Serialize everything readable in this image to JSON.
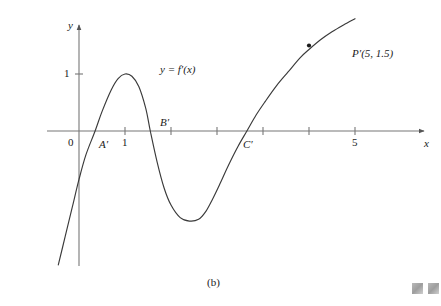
{
  "figure": {
    "caption": "(b)",
    "curve_label": "y = f′(x)",
    "axis_x_name": "x",
    "axis_y_name": "y",
    "origin_label": "0"
  },
  "annotations": {
    "point_A": "A′",
    "point_B": "B′",
    "point_C": "C′",
    "point_P": "P′(5, 1.5)"
  },
  "ticks": {
    "x": [
      {
        "value": 1,
        "label": "1"
      },
      {
        "value": 2,
        "label": ""
      },
      {
        "value": 3,
        "label": ""
      },
      {
        "value": 4,
        "label": ""
      },
      {
        "value": 5,
        "label": "5"
      }
    ],
    "y": [
      {
        "value": 1,
        "label": "1"
      }
    ]
  },
  "colors": {
    "curve": "#3a3a3a",
    "axis": "#707070",
    "text": "#1a1a1a",
    "background": "#ffffff",
    "corner_mark": "#a8a8a8"
  },
  "chart_data": {
    "type": "line",
    "title": "",
    "subtitle": "",
    "xlabel": "x",
    "ylabel": "y",
    "xlim": [
      -0.45,
      6.1
    ],
    "ylim": [
      -2.4,
      2.3
    ],
    "grid": false,
    "legend": null,
    "series": [
      {
        "name": "y = f'(x)",
        "x": [
          -0.45,
          -0.3,
          -0.15,
          0.0,
          0.15,
          0.35,
          0.5,
          0.7,
          0.85,
          1.0,
          1.15,
          1.3,
          1.45,
          1.55,
          1.7,
          1.85,
          2.0,
          2.2,
          2.4,
          2.6,
          2.75,
          2.9,
          3.05,
          3.25,
          3.45,
          3.65,
          3.85,
          4.05,
          4.3,
          4.55,
          4.8,
          5.0,
          5.25,
          5.5,
          5.75,
          6.0
        ],
        "y": [
          -2.35,
          -1.85,
          -1.35,
          -0.85,
          -0.42,
          0.0,
          0.34,
          0.72,
          0.92,
          1.0,
          0.96,
          0.78,
          0.4,
          0.0,
          -0.55,
          -1.0,
          -1.3,
          -1.52,
          -1.58,
          -1.55,
          -1.42,
          -1.2,
          -0.95,
          -0.6,
          -0.28,
          0.0,
          0.28,
          0.52,
          0.8,
          1.04,
          1.28,
          1.43,
          1.6,
          1.74,
          1.86,
          1.97
        ]
      }
    ],
    "annotated_points": [
      {
        "name": "A'",
        "x": 0.35,
        "y": 0.0,
        "label": "A′",
        "marker": false
      },
      {
        "name": "B'",
        "x": 1.55,
        "y": 0.0,
        "label": "B′",
        "marker": false
      },
      {
        "name": "C'",
        "x": 3.65,
        "y": 0.0,
        "label": "C′",
        "marker": false
      },
      {
        "name": "P'",
        "x": 5.0,
        "y": 1.5,
        "label": "P′(5, 1.5)",
        "marker": true
      }
    ],
    "axis_arrows": {
      "x_positive": true,
      "y_positive": true
    }
  }
}
